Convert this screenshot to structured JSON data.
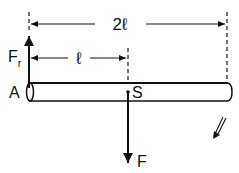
{
  "diagram": {
    "type": "physics-free-body",
    "labels": {
      "reaction_force": "F",
      "reaction_force_sub": "r",
      "pivot": "A",
      "center_of_mass": "S",
      "weight_force": "F",
      "half_length": "ℓ",
      "full_length": "2ℓ"
    },
    "colors": {
      "ink": "#111111",
      "background": "#ffffff"
    }
  }
}
